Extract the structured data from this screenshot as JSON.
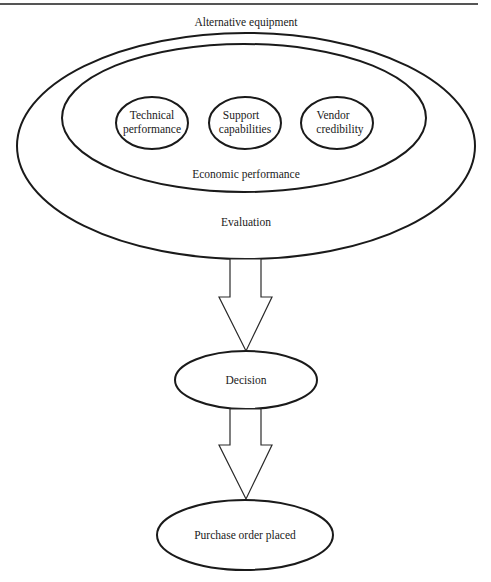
{
  "diagram": {
    "title": "Alternative equipment",
    "outer_ellipse_label": "Evaluation",
    "inner_ellipse_label": "Economic performance",
    "criteria": [
      {
        "line1": "Technical",
        "line2": "performance"
      },
      {
        "line1": "Support",
        "line2": "capabilities"
      },
      {
        "line1": "Vendor",
        "line2": "credibility"
      }
    ],
    "decision_label": "Decision",
    "outcome_label": "Purchase order placed",
    "flow": [
      "Evaluation",
      "Decision",
      "Purchase order placed"
    ]
  }
}
